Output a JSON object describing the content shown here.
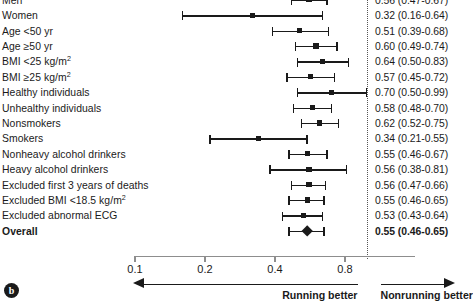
{
  "chart_data": {
    "type": "forest",
    "title": "",
    "xlabel": "",
    "ylabel": "",
    "xscale": "log",
    "xlim": [
      0.1,
      1.1
    ],
    "grid": false,
    "reference_line": 1.0,
    "tick_labels": [
      "0.1",
      "0.2",
      "0.4",
      "0.8"
    ],
    "tick_values": [
      0.1,
      0.2,
      0.4,
      0.8
    ],
    "direction_left_label": "Running better",
    "direction_right_label": "Nonrunning better",
    "panel_tag": "b",
    "rows": [
      {
        "label": "Men",
        "label_sup": "",
        "estimate": 0.56,
        "low": 0.47,
        "high": 0.67,
        "value_text": "0.56 (0.47-0.67)",
        "marker": "square",
        "bold": false
      },
      {
        "label": "Women",
        "label_sup": "",
        "estimate": 0.32,
        "low": 0.16,
        "high": 0.64,
        "value_text": "0.32 (0.16-0.64)",
        "marker": "square",
        "bold": false
      },
      {
        "label": "Age <50 yr",
        "label_sup": "",
        "estimate": 0.51,
        "low": 0.39,
        "high": 0.68,
        "value_text": "0.51 (0.39-0.68)",
        "marker": "square",
        "bold": false
      },
      {
        "label": "Age ≥50 yr",
        "label_sup": "",
        "estimate": 0.6,
        "low": 0.49,
        "high": 0.74,
        "value_text": "0.60 (0.49-0.74)",
        "marker": "square",
        "bold": false
      },
      {
        "label": "BMI <25 kg/m",
        "label_sup": "2",
        "estimate": 0.64,
        "low": 0.5,
        "high": 0.83,
        "value_text": "0.64 (0.50-0.83)",
        "marker": "square",
        "bold": false
      },
      {
        "label": "BMI ≥25 kg/m",
        "label_sup": "2",
        "estimate": 0.57,
        "low": 0.45,
        "high": 0.72,
        "value_text": "0.57 (0.45-0.72)",
        "marker": "square",
        "bold": false
      },
      {
        "label": "Healthy individuals",
        "label_sup": "",
        "estimate": 0.7,
        "low": 0.5,
        "high": 0.99,
        "value_text": "0.70 (0.50-0.99)",
        "marker": "square",
        "bold": false
      },
      {
        "label": "Unhealthy individuals",
        "label_sup": "",
        "estimate": 0.58,
        "low": 0.48,
        "high": 0.7,
        "value_text": "0.58 (0.48-0.70)",
        "marker": "square",
        "bold": false
      },
      {
        "label": "Nonsmokers",
        "label_sup": "",
        "estimate": 0.62,
        "low": 0.52,
        "high": 0.75,
        "value_text": "0.62 (0.52-0.75)",
        "marker": "square",
        "bold": false
      },
      {
        "label": "Smokers",
        "label_sup": "",
        "estimate": 0.34,
        "low": 0.21,
        "high": 0.55,
        "value_text": "0.34 (0.21-0.55)",
        "marker": "square",
        "bold": false
      },
      {
        "label": "Nonheavy alcohol drinkers",
        "label_sup": "",
        "estimate": 0.55,
        "low": 0.46,
        "high": 0.67,
        "value_text": "0.55 (0.46-0.67)",
        "marker": "square",
        "bold": false
      },
      {
        "label": "Heavy alcohol drinkers",
        "label_sup": "",
        "estimate": 0.56,
        "low": 0.38,
        "high": 0.81,
        "value_text": "0.56 (0.38-0.81)",
        "marker": "square",
        "bold": false
      },
      {
        "label": "Excluded first 3 years of deaths",
        "label_sup": "",
        "estimate": 0.56,
        "low": 0.47,
        "high": 0.66,
        "value_text": "0.56 (0.47-0.66)",
        "marker": "square",
        "bold": false
      },
      {
        "label": "Excluded BMI <18.5 kg/m",
        "label_sup": "2",
        "estimate": 0.55,
        "low": 0.46,
        "high": 0.65,
        "value_text": "0.55 (0.46-0.65)",
        "marker": "square",
        "bold": false
      },
      {
        "label": "Excluded abnormal ECG",
        "label_sup": "",
        "estimate": 0.53,
        "low": 0.43,
        "high": 0.64,
        "value_text": "0.53 (0.43-0.64)",
        "marker": "square",
        "bold": false
      },
      {
        "label": "Overall",
        "label_sup": "",
        "estimate": 0.55,
        "low": 0.46,
        "high": 0.65,
        "value_text": "0.55 (0.46-0.65)",
        "marker": "diamond",
        "bold": true
      }
    ]
  },
  "colors": {
    "marker": "#1a1a1a",
    "axis": "#8d8d8d",
    "reference_line": "#555555",
    "text": "#1a1a1a",
    "background": "#ffffff"
  }
}
